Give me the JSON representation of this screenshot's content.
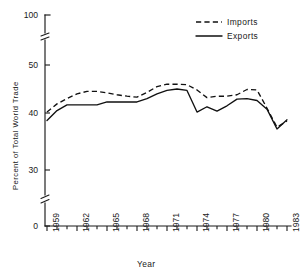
{
  "chart_data": {
    "type": "line",
    "title": "",
    "xlabel": "Year",
    "ylabel": "Percent of Total World Trade",
    "grid": false,
    "legend_position": "top-right",
    "x": [
      1959,
      1960,
      1961,
      1962,
      1963,
      1964,
      1965,
      1966,
      1967,
      1968,
      1969,
      1970,
      1971,
      1972,
      1973,
      1974,
      1975,
      1976,
      1977,
      1978,
      1979,
      1980,
      1981,
      1982,
      1983
    ],
    "xlim": [
      1959,
      1983
    ],
    "ylim": [
      0,
      100
    ],
    "y_axis_breaks": [
      [
        55,
        95
      ],
      [
        5,
        27
      ]
    ],
    "y_tick_labels": [
      "0",
      "30",
      "40",
      "50",
      "100"
    ],
    "y_tick_values": [
      0,
      30,
      40,
      50,
      100
    ],
    "x_tick_labels": [
      "1959",
      "1962",
      "1965",
      "1968",
      "1971",
      "1974",
      "1977",
      "1980",
      "1983"
    ],
    "x_tick_values": [
      1959,
      1962,
      1965,
      1968,
      1971,
      1974,
      1977,
      1980,
      1983
    ],
    "series": [
      {
        "name": "Imports",
        "style": "dashed",
        "color": "#111111",
        "values": [
          40.2,
          41.9,
          43.0,
          44.0,
          44.5,
          44.5,
          44.2,
          43.8,
          43.5,
          43.3,
          44.3,
          45.5,
          46.0,
          46.0,
          45.9,
          44.8,
          43.2,
          43.5,
          43.5,
          43.8,
          44.9,
          44.8,
          41.0,
          37.5,
          38.6
        ]
      },
      {
        "name": "Exports",
        "style": "solid",
        "color": "#111111",
        "values": [
          38.7,
          40.5,
          41.7,
          41.7,
          41.7,
          41.7,
          42.3,
          42.3,
          42.3,
          42.3,
          43.0,
          44.0,
          44.7,
          45.0,
          44.7,
          40.2,
          41.3,
          40.4,
          41.5,
          42.9,
          43.0,
          42.6,
          40.8,
          37.2,
          38.8
        ]
      }
    ]
  },
  "legend": {
    "items": [
      {
        "label": "Imports",
        "style": "dashed"
      },
      {
        "label": "Exports",
        "style": "solid"
      }
    ]
  },
  "axis_titles": {
    "x": "Year",
    "y": "Percent of Total World Trade"
  }
}
